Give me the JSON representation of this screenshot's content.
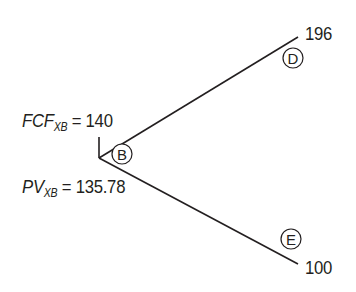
{
  "diagram": {
    "type": "binomial-tree",
    "root_node": {
      "id": "B",
      "fcf_label": {
        "symbol": "FCF",
        "subscript": "XB",
        "value": "140"
      },
      "pv_label": {
        "symbol": "PV",
        "subscript": "XB",
        "value": "135.78"
      }
    },
    "branches": [
      {
        "node_id": "D",
        "value": "196",
        "direction": "up"
      },
      {
        "node_id": "E",
        "value": "100",
        "direction": "down"
      }
    ],
    "colors": {
      "line": "#231f20",
      "text": "#231f20",
      "background": "#ffffff"
    }
  }
}
